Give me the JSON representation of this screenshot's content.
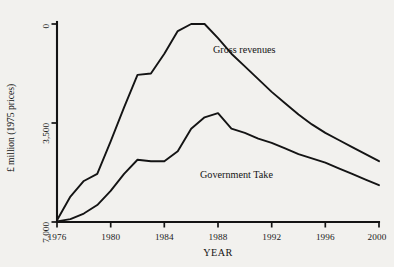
{
  "chart_data": {
    "type": "line",
    "title": "",
    "xlabel": "YEAR",
    "ylabel": "£ million (1975 prices)",
    "xlim": [
      1976,
      2000
    ],
    "ylim": [
      0,
      7000
    ],
    "grid": false,
    "legend_position": "inline-annotation",
    "x_ticks": [
      "1976",
      "1980",
      "1984",
      "1988",
      "1992",
      "1996",
      "2000"
    ],
    "x_tick_values": [
      1976,
      1980,
      1984,
      1988,
      1992,
      1996,
      2000
    ],
    "y_ticks": [
      "0",
      "3,500",
      "7,000"
    ],
    "y_tick_values": [
      0,
      3500,
      7000
    ],
    "x": [
      1976,
      1977,
      1978,
      1979,
      1980,
      1981,
      1982,
      1983,
      1984,
      1985,
      1986,
      1987,
      1988,
      1989,
      1990,
      1991,
      1992,
      1993,
      1994,
      1995,
      1996,
      1997,
      1998,
      1999,
      2000
    ],
    "series": [
      {
        "name": "Gross revenues",
        "values": [
          60,
          900,
          1450,
          1700,
          2850,
          4050,
          5200,
          5250,
          5950,
          6750,
          7000,
          7000,
          6500,
          5950,
          5500,
          5050,
          4600,
          4200,
          3800,
          3450,
          3150,
          2900,
          2650,
          2400,
          2150
        ]
      },
      {
        "name": "Government Take",
        "values": [
          20,
          100,
          300,
          600,
          1100,
          1700,
          2200,
          2150,
          2150,
          2500,
          3300,
          3700,
          3850,
          3300,
          3150,
          2950,
          2800,
          2600,
          2400,
          2250,
          2100,
          1900,
          1700,
          1500,
          1300
        ]
      }
    ],
    "annotations": [
      {
        "text": "Gross revenues",
        "x": 1990,
        "y": 6100
      },
      {
        "text": "Government Take",
        "x": 1989,
        "y": 2350
      }
    ]
  },
  "style": {
    "line_color": "#141414",
    "axis_color": "#141414",
    "background": "#f2f1ee"
  }
}
